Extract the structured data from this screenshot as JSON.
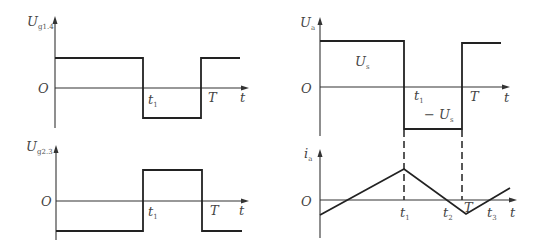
{
  "diagram": {
    "panels": [
      {
        "id": "ug14",
        "ylabel_main": "U",
        "ylabel_sub": "g1.4",
        "origin": "O",
        "xlabel": "t",
        "ticks": [
          {
            "main": "t",
            "sub": "1"
          },
          {
            "main": "T",
            "sub": ""
          }
        ]
      },
      {
        "id": "ug23",
        "ylabel_main": "U",
        "ylabel_sub": "g2.3",
        "origin": "O",
        "xlabel": "t",
        "ticks": [
          {
            "main": "t",
            "sub": "1"
          },
          {
            "main": "T",
            "sub": ""
          }
        ]
      },
      {
        "id": "ua",
        "ylabel_main": "U",
        "ylabel_sub": "a",
        "origin": "O",
        "xlabel": "t",
        "ticks": [
          {
            "main": "t",
            "sub": "1"
          },
          {
            "main": "T",
            "sub": ""
          }
        ],
        "level_high": {
          "main": "U",
          "sub": "s"
        },
        "level_low": {
          "prefix": "− ",
          "main": "U",
          "sub": "s"
        }
      },
      {
        "id": "ia",
        "ylabel_main": "i",
        "ylabel_sub": "a",
        "origin": "O",
        "xlabel": "t",
        "ticks": [
          {
            "main": "t",
            "sub": "1"
          },
          {
            "main": "t",
            "sub": "2"
          },
          {
            "main": "T",
            "sub": ""
          },
          {
            "main": "t",
            "sub": "3"
          }
        ]
      }
    ]
  }
}
